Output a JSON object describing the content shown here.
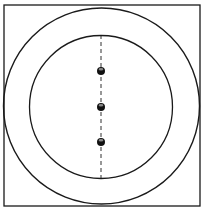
{
  "diagram": {
    "stroke_color": "#1a1a1a",
    "background_color": "#ffffff",
    "square": {
      "x": 4,
      "y": 5,
      "width": 196,
      "height": 201
    },
    "outer_circle": {
      "cx": 101.5,
      "cy": 106,
      "r": 98
    },
    "inner_circle": {
      "cx": 101,
      "cy": 107,
      "r": 71.5
    },
    "dashed_line": {
      "x": 101,
      "y1": 35,
      "y2": 179,
      "dash": "4 3"
    },
    "dots": [
      {
        "cx": 101,
        "cy": 71,
        "r": 4
      },
      {
        "cx": 101,
        "cy": 107,
        "r": 4
      },
      {
        "cx": 101,
        "cy": 142,
        "r": 4
      }
    ],
    "dot_color": "#111111"
  }
}
